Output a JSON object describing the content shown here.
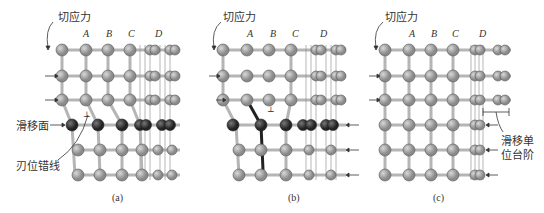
{
  "figure": {
    "panels": [
      {
        "id": "a",
        "caption": "(a)",
        "stress_label": "切应力",
        "columns": [
          "A",
          "B",
          "C",
          "D"
        ],
        "labels": {
          "slip_plane": "滑移面",
          "dislocation_line": "刃位错线"
        }
      },
      {
        "id": "b",
        "caption": "(b)",
        "stress_label": "切应力",
        "columns": [
          "A",
          "B",
          "C",
          "D"
        ]
      },
      {
        "id": "c",
        "caption": "(c)",
        "stress_label": "切应力",
        "columns": [
          "A",
          "B",
          "C",
          "D"
        ],
        "labels": {
          "slip_step_line1": "滑移单",
          "slip_step_line2": "位台阶"
        }
      }
    ],
    "colors": {
      "atom": "#a8a8a8",
      "atom_dark": "#3a3a3a",
      "bond": "#b0b0b0",
      "line": "#555555",
      "text": "#333333"
    }
  }
}
